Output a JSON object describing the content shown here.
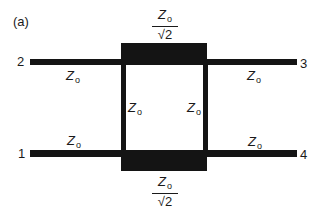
{
  "figure_label": "(a)",
  "ports": {
    "p1": "1",
    "p2": "2",
    "p3": "3",
    "p4": "4"
  },
  "impedance": {
    "symbol": "Z",
    "subscript": "o"
  },
  "series_arm": {
    "denominator": "√2"
  },
  "labels": {
    "line_2_left": "Z_o",
    "line_3_right": "Z_o",
    "line_1_left": "Z_o",
    "line_4_right": "Z_o",
    "shunt_left": "Z_o",
    "shunt_right": "Z_o",
    "series_top": "Z_o/√2",
    "series_bottom": "Z_o/√2"
  },
  "colors": {
    "line": "#141414",
    "background": "#ffffff"
  }
}
